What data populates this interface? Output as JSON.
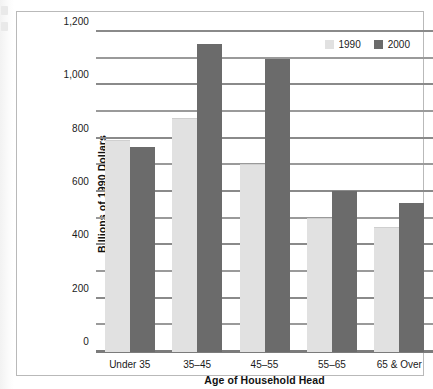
{
  "chart_data": {
    "type": "bar",
    "title": "",
    "xlabel": "Age of Household Head",
    "ylabel": "Billions of 1990 Dollars",
    "categories": [
      "Under 35",
      "35–45",
      "45–55",
      "55–65",
      "65 & Over"
    ],
    "series": [
      {
        "name": "1990",
        "color": "#e1e1e1",
        "values": [
          790,
          875,
          700,
          500,
          465
        ]
      },
      {
        "name": "2000",
        "color": "#6b6b6b",
        "values": [
          770,
          1155,
          1100,
          605,
          560
        ]
      }
    ],
    "ylim": [
      0,
      1200
    ],
    "ytick_values": [
      0,
      200,
      400,
      600,
      800,
      1000,
      1200
    ],
    "ytick_labels": [
      "0",
      "200",
      "400",
      "600",
      "800",
      "1,000",
      "1,200"
    ],
    "yminor_values": [
      100,
      300,
      500,
      700,
      900,
      1100
    ],
    "grid": true,
    "legend_position": "top-right",
    "legend": [
      "1990",
      "2000"
    ]
  },
  "axes": {
    "y_title": "Billions of 1990 Dollars",
    "x_title": "Age of Household Head"
  },
  "legend": {
    "entries": [
      {
        "label": "1990",
        "swatch": "legend-swatch-1990"
      },
      {
        "label": "2000",
        "swatch": "legend-swatch-2000"
      }
    ]
  }
}
